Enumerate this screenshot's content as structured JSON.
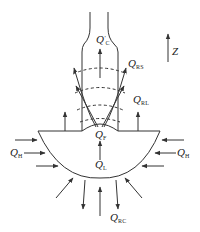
{
  "diagram": {
    "type": "heat-flow schematic",
    "colors": {
      "line": "#333333",
      "background": "#ffffff"
    },
    "axis": {
      "label": "Z",
      "direction": "up"
    },
    "labels": {
      "qc_prime": {
        "main": "Q",
        "prime": "′",
        "sub": "C"
      },
      "qrs": {
        "main": "Q",
        "sub": "RS"
      },
      "qrl": {
        "main": "Q",
        "sub": "RL"
      },
      "qf": {
        "main": "Q",
        "sub": "F"
      },
      "ql": {
        "main": "Q",
        "sub": "L"
      },
      "qh_left": {
        "main": "Q",
        "sub": "H"
      },
      "qh_right": {
        "main": "Q",
        "sub": "H"
      },
      "qrc": {
        "main": "Q",
        "sub": "RC"
      }
    },
    "regions": [
      "neck",
      "bowl",
      "interface-bump",
      "dashed-isotherms"
    ]
  }
}
